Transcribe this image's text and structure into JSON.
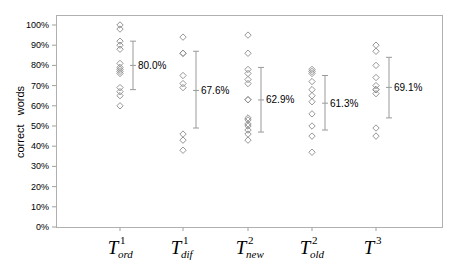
{
  "chart_data": {
    "type": "scatter",
    "title": "",
    "xlabel": "",
    "ylabel": "correct   words",
    "ylim": [
      0,
      100
    ],
    "yticks": [
      "0%",
      "10%",
      "20%",
      "30%",
      "40%",
      "50%",
      "60%",
      "70%",
      "80%",
      "90%",
      "100%"
    ],
    "grid": false,
    "legend": null,
    "categories": [
      {
        "base": "T",
        "sup": "1",
        "sub": "ord"
      },
      {
        "base": "T",
        "sup": "1",
        "sub": "dif"
      },
      {
        "base": "T",
        "sup": "2",
        "sub": "new"
      },
      {
        "base": "T",
        "sup": "2",
        "sub": "old"
      },
      {
        "base": "T",
        "sup": "3",
        "sub": ""
      }
    ],
    "category_labels": [
      "T1_ord",
      "T1_dif",
      "T2_new",
      "T2_old",
      "T3"
    ],
    "points": [
      [
        100,
        98,
        92,
        90,
        88,
        81,
        79,
        78,
        77,
        76,
        69,
        67,
        65,
        60
      ],
      [
        94,
        86,
        86,
        75,
        71,
        69,
        46,
        43,
        38
      ],
      [
        95,
        86,
        78,
        76,
        73,
        71,
        63,
        63,
        54,
        53,
        51,
        50,
        48,
        46,
        43
      ],
      [
        78,
        77,
        76,
        72,
        68,
        65,
        62,
        56,
        50,
        45,
        37
      ],
      [
        90,
        87,
        80,
        74,
        70,
        68,
        68,
        66,
        49,
        45
      ]
    ],
    "means": [
      80.0,
      67.6,
      62.9,
      61.3,
      69.1
    ],
    "mean_labels": [
      "80.0%",
      "67.6%",
      "62.9%",
      "61.3%",
      "69.1%"
    ],
    "error_bars": [
      {
        "low": 68,
        "high": 92
      },
      {
        "low": 49,
        "high": 87
      },
      {
        "low": 47,
        "high": 79
      },
      {
        "low": 48,
        "high": 75
      },
      {
        "low": 54,
        "high": 84
      }
    ],
    "colors": {
      "marker": "#8a8a8a",
      "error_bar": "#9a9a9a",
      "axis": "#a0a0a0",
      "text": "#000000"
    }
  }
}
